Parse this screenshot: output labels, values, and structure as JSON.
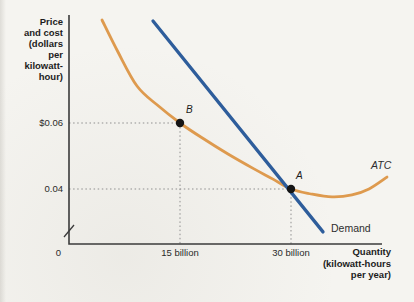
{
  "labels": {
    "y_axis_title": "Price\nand cost\n(dollars\nper\nkilowatt-\nhour)",
    "x_axis_title": "Quantity\n(kilowatt-hours\nper year)",
    "y_tick_006": "$0.06",
    "y_tick_004": "0.04",
    "x_tick_0": "0",
    "x_tick_15": "15 billion",
    "x_tick_30": "30 billion",
    "atc_label": "ATC",
    "demand_label": "Demand",
    "point_b_label": "B",
    "point_a_label": "A"
  },
  "colors": {
    "atc": "#de9a4e",
    "demand": "#2e5d9b",
    "axis": "#3b3b3b",
    "guide": "#8f8f8f",
    "dot": "#151515",
    "background": "#f5f4f0"
  },
  "chart_data": {
    "type": "line",
    "title": "",
    "xlabel": "Quantity (kilowatt-hours per year)",
    "ylabel": "Price and cost (dollars per kilowatt-hour)",
    "x_units": "billions of kilowatt-hours per year",
    "y_units": "dollars per kilowatt-hour",
    "xlim": [
      0,
      43.5
    ],
    "ylim_visible": [
      0.023,
      0.093
    ],
    "axis_break_on_y": true,
    "grid": false,
    "legend_position": "inline-curve-labels",
    "x_ticks": [
      {
        "value": 0,
        "label": "0"
      },
      {
        "value": 15,
        "label": "15 billion"
      },
      {
        "value": 30,
        "label": "30 billion"
      }
    ],
    "y_ticks": [
      {
        "value": 0.06,
        "label": "$0.06"
      },
      {
        "value": 0.04,
        "label": "0.04"
      }
    ],
    "series": [
      {
        "name": "ATC",
        "color": "#de9a4e",
        "shape": "smooth",
        "points": [
          [
            4.46,
            0.0912
          ],
          [
            6.62,
            0.0815
          ],
          [
            9.19,
            0.0712
          ],
          [
            11.89,
            0.0655
          ],
          [
            15.0,
            0.06
          ],
          [
            17.97,
            0.0555
          ],
          [
            21.49,
            0.0506
          ],
          [
            25.0,
            0.0461
          ],
          [
            27.57,
            0.043
          ],
          [
            30.0,
            0.04
          ],
          [
            32.7,
            0.0385
          ],
          [
            35.54,
            0.0376
          ],
          [
            38.24,
            0.0382
          ],
          [
            40.54,
            0.04
          ],
          [
            42.97,
            0.0436
          ]
        ]
      },
      {
        "name": "Demand",
        "color": "#2e5d9b",
        "shape": "straight",
        "points": [
          [
            11.35,
            0.0909
          ],
          [
            34.32,
            0.027
          ]
        ]
      }
    ],
    "marked_points": [
      {
        "label": "B",
        "x": 15,
        "y": 0.06,
        "on": "ATC"
      },
      {
        "label": "A",
        "x": 30,
        "y": 0.04,
        "on": "ATC and Demand intersection"
      }
    ],
    "guide_lines": "dotted lines from each marked point to both axes"
  }
}
